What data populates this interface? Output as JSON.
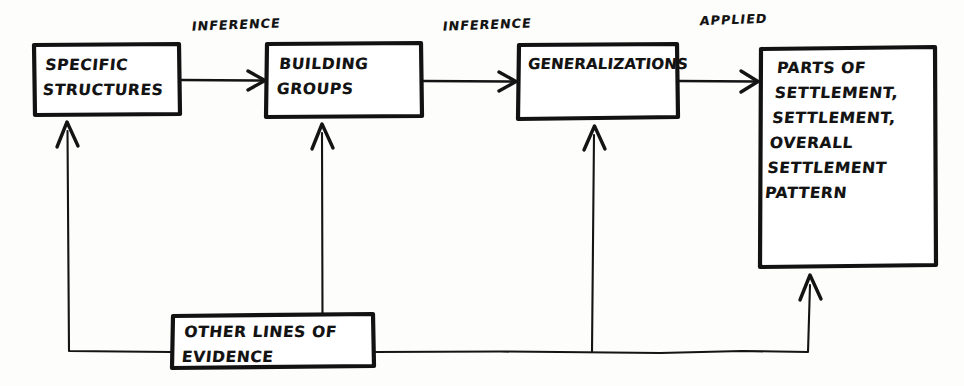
{
  "diagram": {
    "style": "hand-drawn pen sketch",
    "ink_color": "#121212",
    "paper_color": "#fdfdfc",
    "nodes": [
      {
        "id": "specific-structures",
        "label": "SPECIFIC\nSTRUCTURES"
      },
      {
        "id": "building-groups",
        "label": "BUILDING\nGROUPS"
      },
      {
        "id": "generalizations",
        "label": "GENERALIZATIONS"
      },
      {
        "id": "settlement-parts",
        "label": "PARTS OF\nSETTLEMENT,\nSETTLEMENT,\nOVERALL\nSETTLEMENT\nPATTERN"
      },
      {
        "id": "other-evidence",
        "label": "OTHER LINES OF\nEVIDENCE"
      }
    ],
    "edge_labels": [
      {
        "id": "inference-1",
        "label": "INFERENCE"
      },
      {
        "id": "inference-2",
        "label": "INFERENCE"
      },
      {
        "id": "applied",
        "label": "APPLIED"
      }
    ]
  }
}
